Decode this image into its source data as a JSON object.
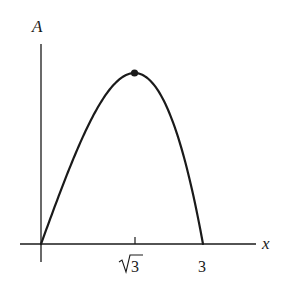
{
  "chart_data": {
    "type": "line",
    "title": "",
    "xlabel": "x",
    "ylabel": "A",
    "function": "A = x(9 - x^2)/2 (shape); maximum at x = sqrt(3)",
    "x_ticks": [
      {
        "value": 1.7320508,
        "label": "√3"
      },
      {
        "value": 3,
        "label": "3"
      }
    ],
    "xlim": [
      0,
      3
    ],
    "ylim": [
      0,
      5.2
    ],
    "max_point": {
      "x": 1.7320508,
      "y": 5.196,
      "marked": true
    },
    "points": [
      {
        "x": 0,
        "y": 0
      },
      {
        "x": 0.5,
        "y": 2.1875
      },
      {
        "x": 1.0,
        "y": 4.0
      },
      {
        "x": 1.5,
        "y": 5.0625
      },
      {
        "x": 1.7320508,
        "y": 5.196
      },
      {
        "x": 2.0,
        "y": 5.0
      },
      {
        "x": 2.5,
        "y": 3.4375
      },
      {
        "x": 3.0,
        "y": 0
      }
    ],
    "grid": false,
    "legend": null
  },
  "labels": {
    "y_axis": "A",
    "x_axis": "x",
    "tick_sqrt3_radicand": "3",
    "tick_3": "3"
  },
  "colors": {
    "ink": "#1a1a1a",
    "background": "#ffffff"
  }
}
